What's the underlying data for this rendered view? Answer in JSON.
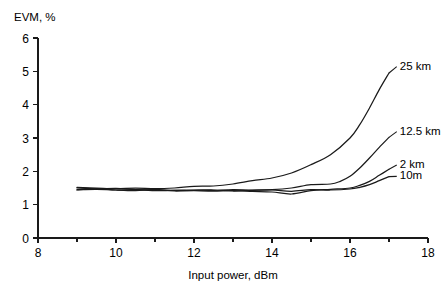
{
  "chart_data": {
    "type": "line",
    "title": "",
    "xlabel": "Input power, dBm",
    "ylabel": "EVM, %",
    "xlim": [
      8,
      18
    ],
    "ylim": [
      0,
      6
    ],
    "xticks": [
      8,
      10,
      12,
      14,
      16,
      18
    ],
    "xtick_labels": [
      "8",
      "10",
      "12",
      "14",
      "16",
      "18"
    ],
    "xminor_ticks": [
      9,
      11,
      13,
      15,
      17
    ],
    "yticks": [
      0,
      1,
      2,
      3,
      4,
      5,
      6
    ],
    "ytick_labels": [
      "0",
      "1",
      "2",
      "3",
      "4",
      "5",
      "6"
    ],
    "grid": false,
    "legend_position": "right-inline-annotations",
    "series": [
      {
        "name": "25 km",
        "label": "25 km",
        "label_x": 17.25,
        "label_y": 5.05,
        "x": [
          9.0,
          9.5,
          10.0,
          10.5,
          11.0,
          11.5,
          12.0,
          12.5,
          13.0,
          13.5,
          14.0,
          14.5,
          15.0,
          15.5,
          16.0,
          16.25,
          16.5,
          16.75,
          17.0
        ],
        "y": [
          1.52,
          1.5,
          1.48,
          1.5,
          1.48,
          1.5,
          1.55,
          1.56,
          1.62,
          1.72,
          1.8,
          1.95,
          2.2,
          2.5,
          3.0,
          3.4,
          3.9,
          4.45,
          4.95
        ]
      },
      {
        "name": "12.5 km",
        "label": "12.5 km",
        "label_x": 17.25,
        "label_y": 3.1,
        "x": [
          9.0,
          9.5,
          10.0,
          10.5,
          11.0,
          11.5,
          12.0,
          12.5,
          13.0,
          13.5,
          14.0,
          14.5,
          15.0,
          15.5,
          15.75,
          16.0,
          16.25,
          16.5,
          16.75,
          17.0
        ],
        "y": [
          1.45,
          1.46,
          1.44,
          1.45,
          1.44,
          1.43,
          1.44,
          1.43,
          1.45,
          1.44,
          1.45,
          1.5,
          1.6,
          1.62,
          1.7,
          1.85,
          2.1,
          2.4,
          2.72,
          3.02
        ]
      },
      {
        "name": "2 km",
        "label": "2 km",
        "label_x": 17.25,
        "label_y": 2.1,
        "x": [
          9.0,
          9.5,
          10.0,
          10.5,
          11.0,
          11.5,
          12.0,
          12.5,
          13.0,
          13.5,
          14.0,
          14.5,
          15.0,
          15.5,
          16.0,
          16.25,
          16.5,
          16.75,
          17.0
        ],
        "y": [
          1.5,
          1.47,
          1.49,
          1.45,
          1.42,
          1.43,
          1.42,
          1.41,
          1.42,
          1.4,
          1.38,
          1.32,
          1.42,
          1.46,
          1.5,
          1.58,
          1.7,
          1.88,
          2.06
        ]
      },
      {
        "name": "10m",
        "label": "10m",
        "label_x": 17.25,
        "label_y": 1.76,
        "x": [
          9.0,
          9.5,
          10.0,
          10.5,
          11.0,
          11.5,
          12.0,
          12.5,
          13.0,
          13.5,
          14.0,
          14.5,
          15.0,
          15.5,
          16.0,
          16.25,
          16.5,
          16.75,
          17.0
        ],
        "y": [
          1.44,
          1.48,
          1.44,
          1.42,
          1.46,
          1.41,
          1.43,
          1.44,
          1.41,
          1.43,
          1.44,
          1.4,
          1.45,
          1.44,
          1.47,
          1.52,
          1.6,
          1.72,
          1.84
        ]
      }
    ]
  }
}
